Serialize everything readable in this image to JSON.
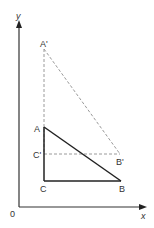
{
  "diagram": {
    "axes": {
      "origin_label": "0",
      "x_label": "x",
      "y_label": "y"
    },
    "triangle_original": {
      "vertices": [
        {
          "name": "A",
          "x": 44,
          "y": 127
        },
        {
          "name": "B",
          "x": 121,
          "y": 181
        },
        {
          "name": "C",
          "x": 44,
          "y": 181
        }
      ],
      "style": "solid",
      "color": "#222222"
    },
    "triangle_image": {
      "vertices": [
        {
          "name": "A'",
          "x": 44,
          "y": 49
        },
        {
          "name": "B'",
          "x": 120,
          "y": 154
        },
        {
          "name": "C'",
          "x": 44,
          "y": 154
        }
      ],
      "style": "dashed",
      "color": "#999999"
    },
    "labels": {
      "A": "A",
      "B": "B",
      "C": "C",
      "A_prime": "A'",
      "B_prime": "B'",
      "C_prime": "C'"
    }
  }
}
